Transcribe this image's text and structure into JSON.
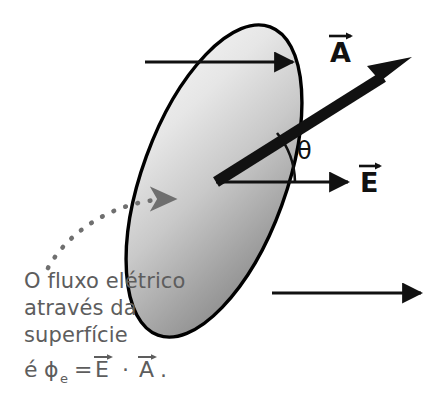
{
  "figure": {
    "background_color": "#ffffff",
    "width": 437,
    "height": 403
  },
  "surface": {
    "name": "surface-ellipse",
    "shape": "ellipse",
    "tilt_degrees": -20,
    "outline_color": "#000000",
    "fill_light": "#eaeaea",
    "fill_dark": "#8c8c8c"
  },
  "vectors": {
    "area_vector": {
      "label": "A",
      "accent": "arrow",
      "color": "#111111",
      "style": "thick"
    },
    "field_vector": {
      "label": "E",
      "accent": "arrow",
      "color": "#111111",
      "style": "thin"
    },
    "angle": {
      "label": "θ",
      "color": "#111111"
    }
  },
  "field_lines": {
    "count": 3,
    "color": "#111111",
    "direction": "right"
  },
  "leader": {
    "name": "dotted-leader",
    "color": "#6f6f6f",
    "style": "dotted",
    "arrowhead": true
  },
  "caption": {
    "lines": [
      "O fluxo elétrico",
      "através da",
      "superfície"
    ],
    "color": "#5d5d5d",
    "formula": {
      "prefix": "é",
      "symbol": "ϕ",
      "subscript": "e",
      "equals": "=",
      "left_operand": "E",
      "operator": "·",
      "right_operand": "A",
      "terminator": "."
    }
  }
}
